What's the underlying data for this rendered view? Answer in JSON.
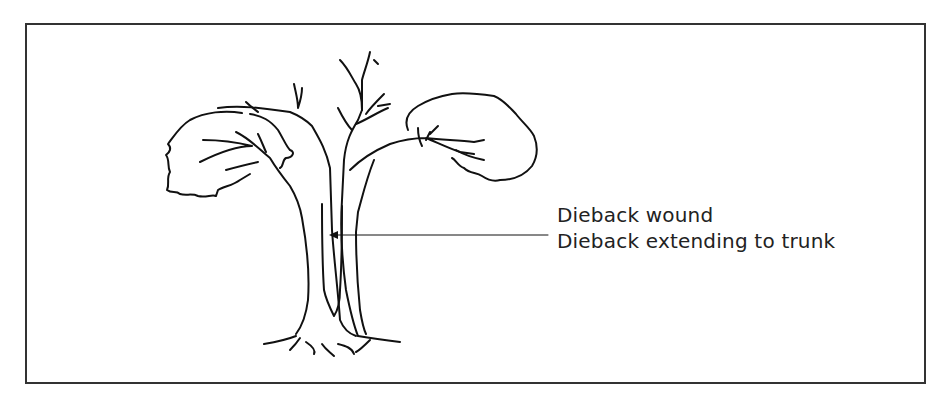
{
  "figure": {
    "labels": [
      "Dieback wound",
      "Dieback extending to trunk"
    ],
    "colors": {
      "line": "#111111",
      "border": "#333333",
      "background": "#ffffff"
    }
  }
}
